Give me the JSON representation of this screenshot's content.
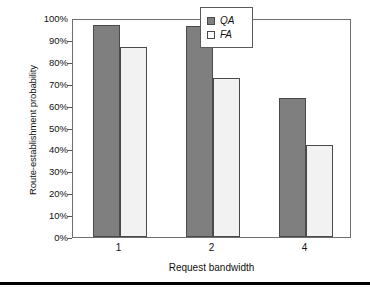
{
  "chart_data": {
    "type": "bar",
    "title": "",
    "xlabel": "Request bandwidth",
    "ylabel": "Route-establishment probability",
    "categories": [
      "1",
      "2",
      "4"
    ],
    "series": [
      {
        "name": "QA",
        "values": [
          97.0,
          96.5,
          63.5
        ],
        "color": "#7f7f7f"
      },
      {
        "name": "FA",
        "values": [
          86.7,
          72.5,
          42.0
        ],
        "color": "#f2f2f2"
      }
    ],
    "ylim": [
      0,
      100
    ],
    "yticks": [
      "0%",
      "10%",
      "20%",
      "30%",
      "40%",
      "50%",
      "60%",
      "70%",
      "80%",
      "90%",
      "100%"
    ],
    "ytick_values": [
      0,
      10,
      20,
      30,
      40,
      50,
      60,
      70,
      80,
      90,
      100
    ],
    "grid": false,
    "legend_position": "top-right",
    "legend_entries": [
      "QA",
      "FA"
    ],
    "value_suffix": "%"
  }
}
